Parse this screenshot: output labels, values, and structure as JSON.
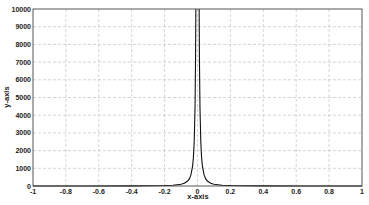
{
  "chart_data": {
    "type": "line",
    "title": "",
    "xlabel": "x-axis",
    "ylabel": "y-axis",
    "xlim": [
      -1,
      1
    ],
    "ylim": [
      0,
      10000
    ],
    "grid": true,
    "legend": "none",
    "x_ticks": [
      -1,
      -0.8,
      -0.6,
      -0.4,
      -0.2,
      0,
      0.2,
      0.4,
      0.6,
      0.8,
      1
    ],
    "x_tick_labels": [
      "-1",
      "-0.8",
      "-0.6",
      "-0.4",
      "-0.2",
      "0",
      "0.2",
      "0.4",
      "0.6",
      "0.8",
      "1"
    ],
    "y_ticks": [
      0,
      1000,
      2000,
      3000,
      4000,
      5000,
      6000,
      7000,
      8000,
      9000,
      10000
    ],
    "y_tick_labels": [
      "0",
      "1000",
      "2000",
      "3000",
      "4000",
      "5000",
      "6000",
      "7000",
      "8000",
      "9000",
      "10000"
    ],
    "series": [
      {
        "name": "y = 1/x^2",
        "color": "#111111",
        "x": [
          -1,
          -0.8,
          -0.6,
          -0.4,
          -0.3,
          -0.2,
          -0.15,
          -0.1,
          -0.08,
          -0.06,
          -0.05,
          -0.04,
          -0.03,
          -0.025,
          -0.02,
          -0.015,
          -0.012,
          -0.01,
          0.01,
          0.012,
          0.015,
          0.02,
          0.025,
          0.03,
          0.04,
          0.05,
          0.06,
          0.08,
          0.1,
          0.15,
          0.2,
          0.3,
          0.4,
          0.6,
          0.8,
          1
        ],
        "y": [
          1,
          1.56,
          2.78,
          6.25,
          11.1,
          25,
          44.4,
          100,
          156,
          278,
          400,
          625,
          1111,
          1600,
          2500,
          4444,
          6944,
          10000,
          10000,
          6944,
          4444,
          2500,
          1600,
          1111,
          625,
          400,
          278,
          156,
          100,
          44.4,
          25,
          11.1,
          6.25,
          2.78,
          1.56,
          1
        ]
      }
    ]
  }
}
